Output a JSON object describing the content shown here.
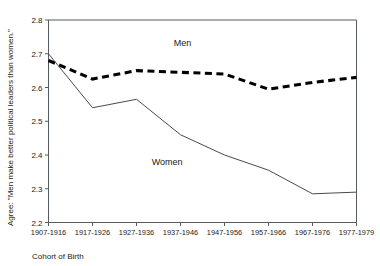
{
  "chart_data": {
    "type": "line",
    "title": "",
    "xlabel": "Cohort of Birth",
    "ylabel": "Agree: \"Men make better political leaders than women.\"",
    "categories": [
      "1907-1916",
      "1917-1926",
      "1927-1936",
      "1937-1946",
      "1947-1956",
      "1957-1966",
      "1967-1976",
      "1977-1979"
    ],
    "ylim": [
      2.2,
      2.8
    ],
    "yticks": [
      "2.2",
      "2.3",
      "2.4",
      "2.5",
      "2.6",
      "2.7",
      "2.8"
    ],
    "grid": false,
    "legend_position": "inline-annotation",
    "series": [
      {
        "name": "Men",
        "style": "dashed-thick",
        "color": "#000000",
        "values": [
          2.68,
          2.625,
          2.65,
          2.645,
          2.64,
          2.595,
          2.615,
          2.63
        ]
      },
      {
        "name": "Women",
        "style": "solid-thin",
        "color": "#4a4a4a",
        "values": [
          2.7,
          2.54,
          2.565,
          2.46,
          2.4,
          2.355,
          2.285,
          2.29
        ]
      }
    ],
    "annotations": [
      {
        "text": "Men",
        "x_frac": 0.435,
        "y_value": 2.722
      },
      {
        "text": "Women",
        "x_frac": 0.385,
        "y_value": 2.372
      }
    ]
  }
}
